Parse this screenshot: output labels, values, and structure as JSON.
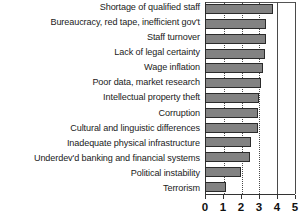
{
  "chart_data": {
    "type": "bar",
    "orientation": "horizontal",
    "title": "",
    "subtitle": "",
    "xlabel": "",
    "ylabel": "",
    "xlim": [
      0,
      5
    ],
    "grid": true,
    "legend": null,
    "xticks": [
      0,
      1,
      2,
      3,
      4,
      5
    ],
    "xtick_labels": [
      "0",
      "1",
      "2",
      "3",
      "4",
      "5"
    ],
    "categories": [
      "Shortage of qualified staff",
      "Bureaucracy, red tape, inefficient gov't",
      "Staff turnover",
      "Lack of legal certainty",
      "Wage inflation",
      "Poor data, market research",
      "Intellectual property theft",
      "Corruption",
      "Cultural and linguistic differences",
      "Inadequate physical infrastructure",
      "Underdev'd banking and financial systems",
      "Political instability",
      "Terrorism"
    ],
    "values": [
      3.8,
      3.45,
      3.4,
      3.35,
      3.25,
      3.15,
      3.05,
      3.0,
      2.95,
      2.6,
      2.5,
      2.0,
      1.2
    ],
    "series": [
      {
        "name": "Severity rating",
        "values": [
          3.8,
          3.45,
          3.4,
          3.35,
          3.25,
          3.15,
          3.05,
          3.0,
          2.95,
          2.6,
          2.5,
          2.0,
          1.2
        ]
      }
    ],
    "colors": {
      "bar_fill": "#828282",
      "bar_border": "#2b2b2b",
      "axis": "#333333",
      "gridline": "#4a4a4a",
      "background": "#ffffff",
      "text": "#1a1a1a"
    }
  }
}
